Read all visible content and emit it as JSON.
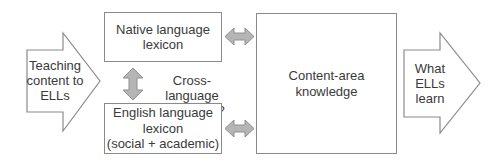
{
  "diagram": {
    "input_arrow": {
      "lines": [
        "Teaching",
        "content to",
        "ELLs"
      ]
    },
    "native_box": {
      "lines": [
        "Native language",
        "lexicon"
      ]
    },
    "english_box": {
      "lines": [
        "English language",
        "lexicon",
        "(social + academic)"
      ]
    },
    "transfer_label": {
      "lines": [
        "Cross-language",
        "transfer?"
      ]
    },
    "center_box": {
      "lines": [
        "Content-area",
        "knowledge"
      ]
    },
    "output_arrow": {
      "lines": [
        "What",
        "ELLs",
        "learn"
      ]
    },
    "colors": {
      "outline": "#8a8a8a",
      "connector_fill": "#b5b5b5",
      "connector_stroke": "#8f8f8f",
      "text": "#3a3a3a"
    },
    "connectors": [
      {
        "from": "native_box",
        "to": "english_box",
        "type": "bidirectional-vertical"
      },
      {
        "from": "native_box",
        "to": "center_box",
        "type": "bidirectional-horizontal"
      },
      {
        "from": "english_box",
        "to": "center_box",
        "type": "bidirectional-horizontal"
      }
    ]
  }
}
